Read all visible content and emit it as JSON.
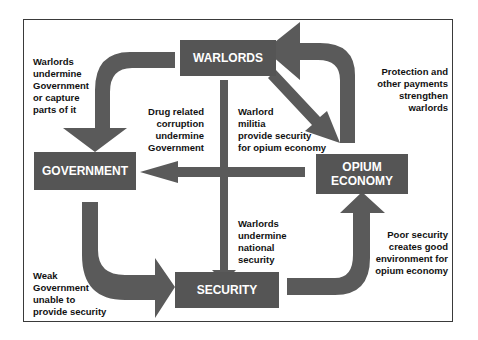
{
  "nodes": {
    "warlords": "WARLORDS",
    "government": "GOVERNMENT",
    "opium_economy": "OPIUM\nECONOMY",
    "security": "SECURITY"
  },
  "labels": {
    "warlords_undermine_gov": "Warlords\nundermine\nGovernment\nor capture\nparts of it",
    "drug_corruption": "Drug related\ncorruption\nundermine\nGovernment",
    "militia_security": "Warlord\nmilitia\nprovide security\nfor opium economy",
    "protection_payments": "Protection and\nother payments\nstrengthen\nwarlords",
    "warlords_undermine_security": "Warlords\nundermine\nnational\nsecurity",
    "poor_security": "Poor security\ncreates good\nenvironment for\nopium economy",
    "weak_government": "Weak\nGovernment\nunable to\nprovide security"
  },
  "colors": {
    "box": "#555555",
    "arrow": "#5a5a5a",
    "frame": "#3a3a3a"
  }
}
